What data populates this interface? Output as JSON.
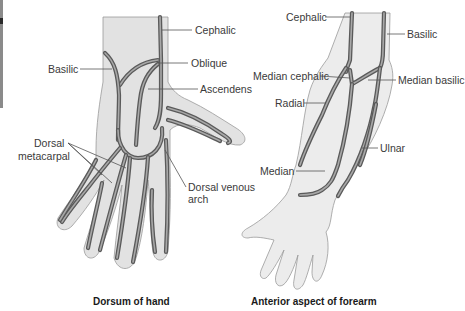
{
  "figure": {
    "left_panel": {
      "caption": "Dorsum of hand",
      "labels": {
        "cephalic": "Cephalic",
        "basilic": "Basilic",
        "oblique": "Oblique",
        "ascendens": "Ascendens",
        "dorsal_metacarpal_1": "Dorsal",
        "dorsal_metacarpal_2": "metacarpal",
        "dorsal_venous_arch_1": "Dorsal venous",
        "dorsal_venous_arch_2": "arch"
      }
    },
    "right_panel": {
      "caption": "Anterior aspect of forearm",
      "labels": {
        "cephalic": "Cephalic",
        "basilic": "Basilic",
        "median_cephalic": "Median cephalic",
        "median_basilic": "Median basilic",
        "radial": "Radial",
        "ulnar": "Ulnar",
        "median": "Median"
      }
    },
    "colors": {
      "skin": "#e2e2e2",
      "vein": "#5a5a5a",
      "label_text": "#3a3a3a"
    }
  }
}
